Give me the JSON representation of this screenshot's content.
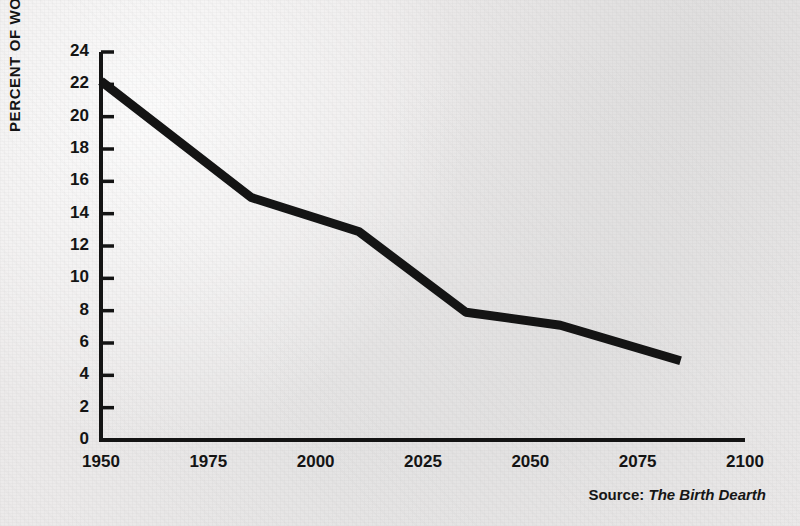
{
  "figure": {
    "source_prefix": "Source:",
    "source_title": "The Birth Dearth",
    "background_color": "#eceaea",
    "ink_color": "#141414"
  },
  "chart_data": {
    "type": "line",
    "title": "",
    "xlabel": "",
    "ylabel": "PERCENT OF WORLD POPULATION",
    "xlim": [
      1950,
      2100
    ],
    "ylim": [
      0,
      24
    ],
    "grid": false,
    "legend": false,
    "xticks": [
      1950,
      1975,
      2000,
      2025,
      2050,
      2075,
      2100
    ],
    "xtick_labels": [
      "1950",
      "1975",
      "2000",
      "2025",
      "2050",
      "2075",
      "2100"
    ],
    "yticks": [
      0,
      2,
      4,
      6,
      8,
      10,
      12,
      14,
      16,
      18,
      20,
      22,
      24
    ],
    "ytick_labels": [
      "0",
      "2",
      "4",
      "6",
      "8",
      "10",
      "12",
      "14",
      "16",
      "18",
      "20",
      "22",
      "24"
    ],
    "series": [
      {
        "name": "Percent of world population",
        "color": "#141414",
        "line_width": 9,
        "x": [
          1950,
          1985,
          2010,
          2035,
          2057,
          2085
        ],
        "values": [
          22.2,
          15.0,
          12.9,
          7.9,
          7.1,
          4.9
        ]
      }
    ]
  }
}
